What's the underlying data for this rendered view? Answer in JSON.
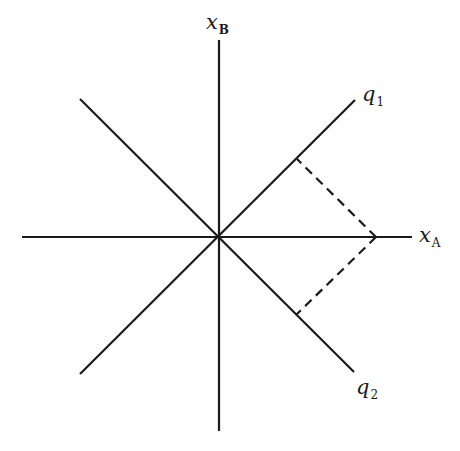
{
  "diagram": {
    "title": "",
    "origin": {
      "x": 219,
      "y": 237
    },
    "axes": [
      {
        "id": "x_A",
        "from": [
          22,
          237
        ],
        "to": [
          412,
          237
        ]
      },
      {
        "id": "x_B",
        "from": [
          219,
          40
        ],
        "to": [
          219,
          431
        ]
      },
      {
        "id": "q1",
        "from": [
          80,
          99
        ],
        "to": [
          355,
          101
        ]
      },
      {
        "id": "q2",
        "from": [
          80,
          372
        ],
        "to": [
          354,
          370
        ]
      }
    ],
    "projections": [
      {
        "from": [
          376,
          237
        ],
        "to": [
          297,
          160
        ],
        "style": "dashed",
        "onto": "q1"
      },
      {
        "from": [
          376,
          237
        ],
        "to": [
          296,
          313
        ],
        "style": "dashed",
        "onto": "q2"
      }
    ],
    "labels": {
      "xB": {
        "main": "x",
        "sub": "B"
      },
      "xA": {
        "main": "x",
        "sub": "A"
      },
      "q1": {
        "main": "q",
        "sub": "1"
      },
      "q2": {
        "main": "q",
        "sub": "2"
      }
    },
    "line_color": "#1a1a1a",
    "background": "#ffffff"
  }
}
